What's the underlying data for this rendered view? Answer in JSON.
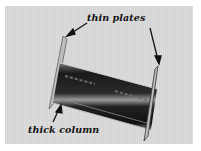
{
  "figure": {
    "annotations": [
      {
        "id": "thin-plates",
        "text": "thin plates",
        "arrows": 2
      },
      {
        "id": "thick-column",
        "text": "thick column",
        "arrows": 1
      }
    ]
  },
  "colors": {
    "background": "#d8d8d8",
    "border": "#ffffff",
    "ink": "#111111"
  }
}
